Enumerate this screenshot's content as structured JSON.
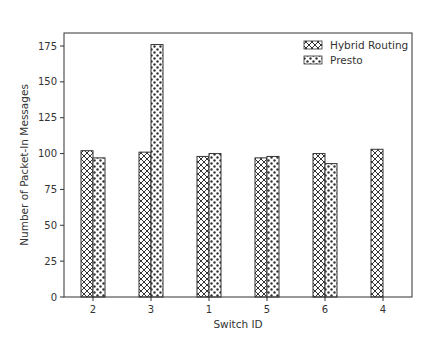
{
  "chart_data": {
    "type": "bar",
    "title": "",
    "xlabel": "Switch ID",
    "ylabel": "Number of Packet-In Messages",
    "categories": [
      "2",
      "3",
      "1",
      "5",
      "6",
      "4"
    ],
    "series": [
      {
        "name": "Hybrid Routing",
        "pattern": "crosshatch",
        "values": [
          102,
          101,
          98,
          97,
          100,
          103
        ]
      },
      {
        "name": "Presto",
        "pattern": "dots",
        "values": [
          97,
          176,
          100,
          98,
          93,
          0
        ]
      }
    ],
    "ylim": [
      0,
      185
    ],
    "yticks": [
      0,
      25,
      50,
      75,
      100,
      125,
      150,
      175
    ],
    "grid": false,
    "legend_position": "upper right"
  }
}
